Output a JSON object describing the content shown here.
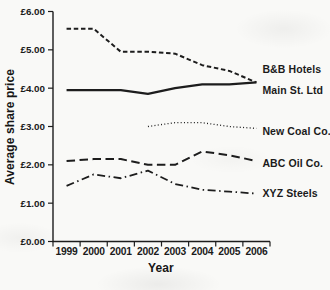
{
  "chart_data": {
    "type": "line",
    "title": "",
    "xlabel": "Year",
    "ylabel": "Average share price",
    "x": [
      "1999",
      "2000",
      "2001",
      "2002",
      "2003",
      "2004",
      "2005",
      "2006"
    ],
    "ylim": [
      0,
      6
    ],
    "y_ticks": [
      {
        "value": 6,
        "label": "£6.00"
      },
      {
        "value": 5,
        "label": "£5.00"
      },
      {
        "value": 4,
        "label": "£4.00"
      },
      {
        "value": 3,
        "label": "£3.00"
      },
      {
        "value": 2,
        "label": "£2.00"
      },
      {
        "value": 1,
        "label": "£1.00"
      },
      {
        "value": 0,
        "label": "£0.00"
      }
    ],
    "grid": false,
    "legend_position": "labels-at-line-ends",
    "line_color": "#1d1d1d",
    "axis_color": "#1d1d1d",
    "series": [
      {
        "name": "B&B Hotels",
        "style": "dashed",
        "values": [
          5.55,
          5.55,
          4.95,
          4.95,
          4.9,
          4.6,
          4.45,
          4.15
        ]
      },
      {
        "name": "Main St. Ltd",
        "style": "solid",
        "values": [
          3.95,
          3.95,
          3.95,
          3.85,
          4.0,
          4.1,
          4.1,
          4.15
        ]
      },
      {
        "name": "New Coal Co.",
        "style": "dotted",
        "values": [
          null,
          null,
          null,
          3.0,
          3.1,
          3.1,
          3.0,
          2.95
        ]
      },
      {
        "name": "ABC Oil Co.",
        "style": "long-dash",
        "values": [
          2.1,
          2.15,
          2.15,
          2.0,
          2.0,
          2.35,
          2.25,
          2.1
        ]
      },
      {
        "name": "XYZ Steels",
        "style": "dash-dot",
        "values": [
          1.45,
          1.75,
          1.65,
          1.85,
          1.5,
          1.35,
          1.3,
          1.25
        ]
      }
    ]
  }
}
